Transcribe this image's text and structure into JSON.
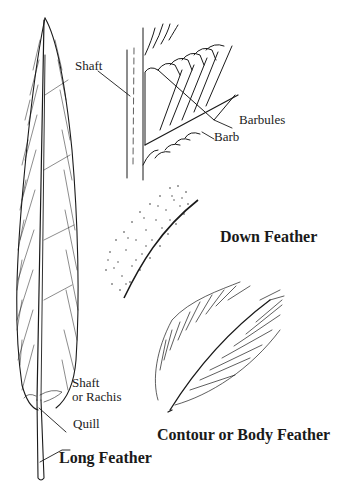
{
  "diagram": {
    "feathers": [
      {
        "id": "long",
        "title": "Long Feather",
        "labels": [
          {
            "text": "Shaft"
          },
          {
            "text": "or Rachis"
          },
          {
            "text": "Quill"
          }
        ]
      },
      {
        "id": "detail",
        "title": "",
        "labels": [
          {
            "text": "Shaft"
          },
          {
            "text": "Barbules"
          },
          {
            "text": "Barb"
          }
        ]
      },
      {
        "id": "down",
        "title": "Down Feather",
        "labels": []
      },
      {
        "id": "contour",
        "title": "Contour or Body Feather",
        "labels": []
      }
    ]
  },
  "colors": {
    "ink": "#1a1a1a",
    "background": "#ffffff"
  }
}
